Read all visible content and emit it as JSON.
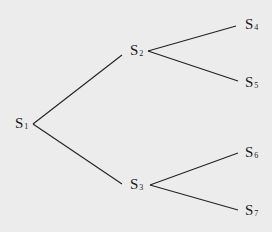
{
  "diagram": {
    "type": "tree",
    "background": "#ececec",
    "line_color": "#222222",
    "nodes": [
      {
        "id": "S1",
        "letter": "S",
        "sub": "1",
        "x": 15,
        "y": 116
      },
      {
        "id": "S2",
        "letter": "S",
        "sub": "2",
        "x": 130,
        "y": 43
      },
      {
        "id": "S3",
        "letter": "S",
        "sub": "3",
        "x": 130,
        "y": 177
      },
      {
        "id": "S4",
        "letter": "S",
        "sub": "4",
        "x": 245,
        "y": 17
      },
      {
        "id": "S5",
        "letter": "S",
        "sub": "5",
        "x": 245,
        "y": 75
      },
      {
        "id": "S6",
        "letter": "S",
        "sub": "6",
        "x": 245,
        "y": 145
      },
      {
        "id": "S7",
        "letter": "S",
        "sub": "7",
        "x": 245,
        "y": 203
      }
    ],
    "edges": [
      {
        "from": "S1",
        "to": "S2",
        "x1": 33,
        "y1": 124,
        "x2": 122,
        "y2": 55
      },
      {
        "from": "S1",
        "to": "S3",
        "x1": 33,
        "y1": 124,
        "x2": 122,
        "y2": 184
      },
      {
        "from": "S2",
        "to": "S4",
        "x1": 148,
        "y1": 51,
        "x2": 236,
        "y2": 26
      },
      {
        "from": "S2",
        "to": "S5",
        "x1": 148,
        "y1": 51,
        "x2": 238,
        "y2": 81
      },
      {
        "from": "S3",
        "to": "S6",
        "x1": 150,
        "y1": 185,
        "x2": 238,
        "y2": 153
      },
      {
        "from": "S3",
        "to": "S7",
        "x1": 150,
        "y1": 185,
        "x2": 238,
        "y2": 210
      }
    ]
  }
}
